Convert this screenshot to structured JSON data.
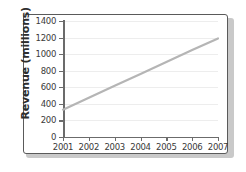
{
  "chart_data": {
    "type": "line",
    "title": "",
    "xlabel": "",
    "ylabel": "Revenue (millions)",
    "x": [
      2001,
      2002,
      2003,
      2004,
      2005,
      2006,
      2007
    ],
    "categories": [
      "2001",
      "2002",
      "2003",
      "2004",
      "2005",
      "2006",
      "2007"
    ],
    "series": [
      {
        "name": "Revenue",
        "values": [
          330,
          475,
          620,
          760,
          905,
          1050,
          1190
        ],
        "color": "#b5b5b5"
      }
    ],
    "ylim": [
      0,
      1400
    ],
    "xlim": [
      2001,
      2007
    ],
    "yticks": [
      0,
      200,
      400,
      600,
      800,
      1000,
      1200,
      1400
    ],
    "ytick_labels": [
      "0",
      "200",
      "400",
      "600",
      "800",
      "1000",
      "1200",
      "1400"
    ],
    "xticks": [
      2001,
      2002,
      2003,
      2004,
      2005,
      2006,
      2007
    ],
    "xtick_labels": [
      "2001",
      "2002",
      "2003",
      "2004",
      "2005",
      "2006",
      "2007"
    ],
    "grid": true,
    "grid_axis": "y",
    "legend": false,
    "legend_position": "none"
  },
  "style": {
    "frame_border_color": "#5a5a5a",
    "axis_color": "#6b6b6b",
    "gridline_color": "#ededed",
    "line_color": "#b5b5b5",
    "text_color": "#3a3a3a",
    "label_color": "#2e2e2e",
    "background": "#ffffff"
  }
}
